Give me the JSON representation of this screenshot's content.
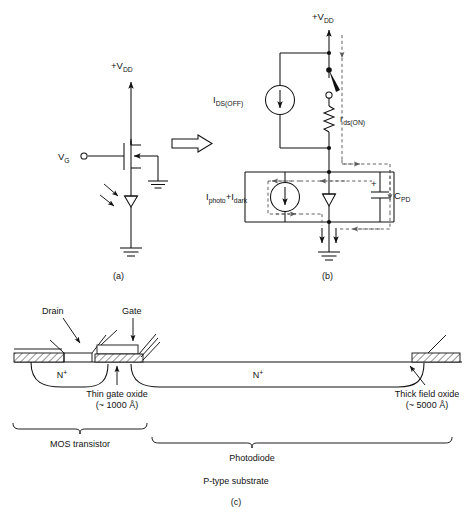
{
  "figure": {
    "subfigure_captions": {
      "a": "(a)",
      "b": "(b)",
      "c": "(c)"
    }
  },
  "panel_a": {
    "name": "photodiode MOS transistor circuit",
    "supply_label": "+V",
    "supply_sub": "DD",
    "gate_label": "V",
    "gate_sub": "G",
    "components": [
      {
        "name": "mos-transistor",
        "type": "n-channel MOSFET"
      },
      {
        "name": "photodiode",
        "type": "light sensitive diode"
      },
      {
        "name": "ground-symbol",
        "type": "ground"
      },
      {
        "name": "light-arrows",
        "type": "incident illumination"
      }
    ],
    "transition_arrow": "equivalent-to"
  },
  "panel_b": {
    "name": "equivalent circuit model",
    "supply_label": "+V",
    "supply_sub": "DD",
    "current_source_off": {
      "main": "I",
      "sub": "DS(OFF)"
    },
    "resistor": {
      "main": "r",
      "sub": "ds(ON)"
    },
    "current_source_photo": {
      "first_main": "I",
      "first_sub": "photo",
      "plus": "+",
      "second_main": "I",
      "second_sub": "dark"
    },
    "capacitor": {
      "main": "C",
      "sub": "PD",
      "polarity": "+"
    },
    "components": [
      {
        "name": "switch",
        "type": "single pole open switch"
      },
      {
        "name": "diode",
        "type": "photodiode junction"
      },
      {
        "name": "ground-symbol",
        "type": "ground"
      }
    ],
    "current_path_style": "dashed loop arrows"
  },
  "panel_c": {
    "name": "device cross section",
    "labels": {
      "drain": "Drain",
      "gate": "Gate",
      "n_plus_left": "N",
      "n_plus_left_sup": "+",
      "n_plus_right": "N",
      "n_plus_right_sup": "+",
      "thin_oxide_line1": "Thin gate oxide",
      "thin_oxide_line2": "(~ 1000 Å)",
      "thick_oxide_line1": "Thick field oxide",
      "thick_oxide_line2": "(~ 5000 Å)",
      "mos_transistor": "MOS transistor",
      "photodiode": "Photodiode",
      "substrate": "P-type substrate"
    }
  },
  "colors": {
    "ink": "#111111",
    "dashed": "#5b5b5b",
    "background": "#ffffff"
  }
}
